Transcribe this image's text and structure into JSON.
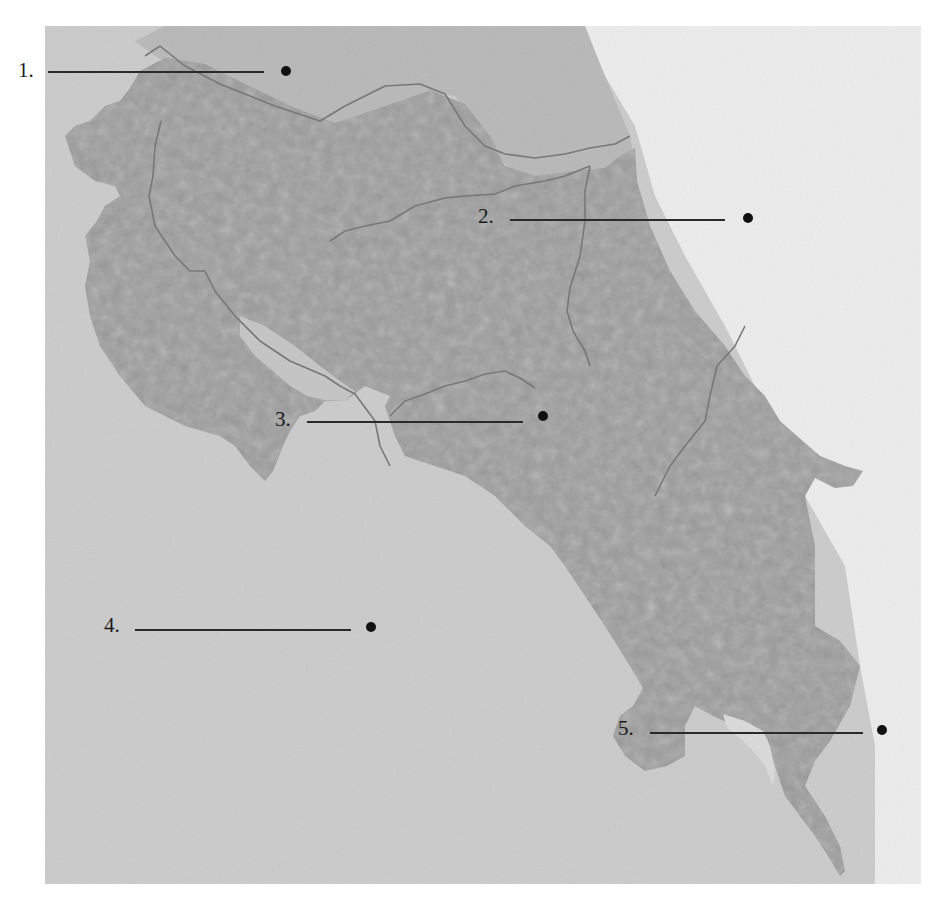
{
  "map": {
    "subject": "Costa Rica blank relief map",
    "colors": {
      "pacific_sea": "#cbcbcb",
      "caribbean_sea": "#ececec",
      "land": "#9e9e9e",
      "border": "#7a7a7a",
      "text": "#1a1a1a"
    }
  },
  "labels": [
    {
      "number": "1.",
      "answer": "",
      "x": 18,
      "y": 58,
      "line_start": 48,
      "line_end": 264,
      "dot_x": 286
    },
    {
      "number": "2.",
      "answer": "",
      "x": 478,
      "y": 204,
      "line_start": 510,
      "line_end": 725,
      "dot_x": 748
    },
    {
      "number": "3.",
      "answer": "",
      "x": 275,
      "y": 407,
      "line_start": 307,
      "line_end": 523,
      "dot_x": 543
    },
    {
      "number": "4.",
      "answer": "",
      "x": 104,
      "y": 613,
      "line_start": 135,
      "line_end": 351,
      "dot_x": 371
    },
    {
      "number": "5.",
      "answer": "",
      "x": 618,
      "y": 716,
      "line_start": 650,
      "line_end": 863,
      "dot_x": 882
    }
  ]
}
